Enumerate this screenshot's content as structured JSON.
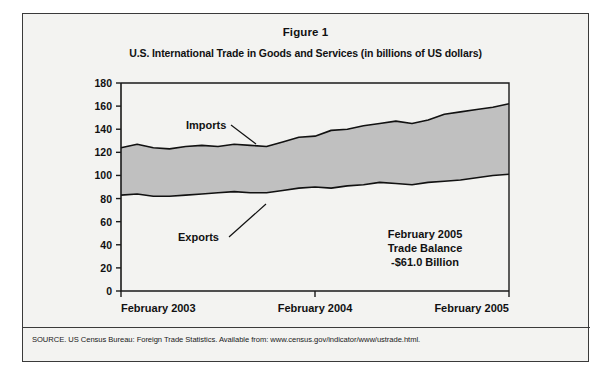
{
  "figure": {
    "title": "Figure 1",
    "subtitle": "U.S. International Trade in Goods and Services (in billions of US dollars)",
    "source_note": "SOURCE. US Census Bureau: Foreign Trade Statistics. Available from: www.census.gov/indicator/www/ustrade.html."
  },
  "callout": {
    "line1": "February 2005",
    "line2": "Trade Balance",
    "line3": "-$61.0 Billion"
  },
  "colors": {
    "band_fill": "#c0c0c0",
    "line": "#111111",
    "axis": "#1a1a1a",
    "panel_bg": "#f3f3f1",
    "border": "#3a3a3a"
  },
  "chart_data": {
    "type": "area",
    "title": "U.S. International Trade in Goods and Services (in billions of US dollars)",
    "xlabel": "",
    "ylabel": "",
    "ylim": [
      0,
      180
    ],
    "ytick_step": 20,
    "yticks": [
      0,
      20,
      40,
      60,
      80,
      100,
      120,
      140,
      160,
      180
    ],
    "grid": false,
    "legend": "inline-annotations",
    "xtick_labels": [
      "February 2003",
      "February 2004",
      "February 2005"
    ],
    "x": [
      "Feb 2003",
      "Mar 2003",
      "Apr 2003",
      "May 2003",
      "Jun 2003",
      "Jul 2003",
      "Aug 2003",
      "Sep 2003",
      "Oct 2003",
      "Nov 2003",
      "Dec 2003",
      "Jan 2004",
      "Feb 2004",
      "Mar 2004",
      "Apr 2004",
      "May 2004",
      "Jun 2004",
      "Jul 2004",
      "Aug 2004",
      "Sep 2004",
      "Oct 2004",
      "Nov 2004",
      "Dec 2004",
      "Jan 2005",
      "Feb 2005"
    ],
    "series": [
      {
        "name": "Imports",
        "values": [
          124,
          127,
          124,
          123,
          125,
          126,
          125,
          127,
          126,
          125,
          129,
          133,
          134,
          139,
          140,
          143,
          145,
          147,
          145,
          148,
          153,
          155,
          157,
          159,
          162
        ]
      },
      {
        "name": "Exports",
        "values": [
          83,
          84,
          82,
          82,
          83,
          84,
          85,
          86,
          85,
          85,
          87,
          89,
          90,
          89,
          91,
          92,
          94,
          93,
          92,
          94,
          95,
          96,
          98,
          100,
          101
        ]
      }
    ],
    "annotations": [
      {
        "text": "Imports",
        "attached_to": "Imports"
      },
      {
        "text": "Exports",
        "attached_to": "Exports"
      },
      {
        "text": "February 2005 Trade Balance -$61.0 Billion",
        "attached_to": "balance"
      }
    ]
  }
}
